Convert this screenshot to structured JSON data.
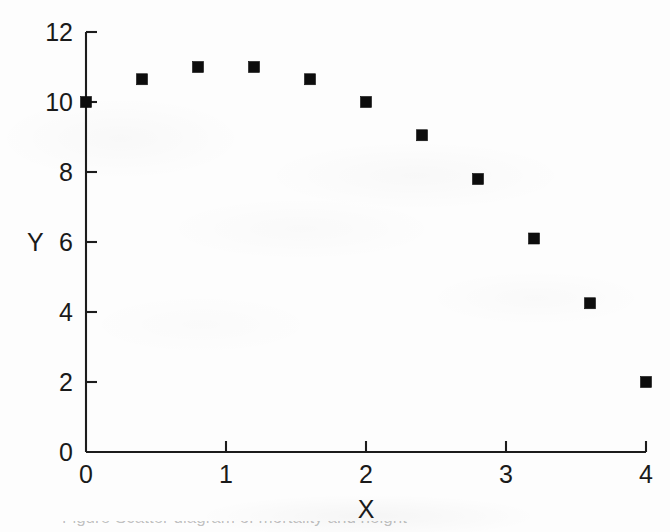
{
  "figure": {
    "background_color": "#fdfdfd",
    "ink_color": "#1a1a1a",
    "marker_color": "#0d0d0d",
    "x_axis_title": "X",
    "y_axis_title": "Y",
    "caption_fragment": "Figure    Scatter diagram of mortality and  height"
  },
  "chart_data": {
    "type": "scatter",
    "title": "",
    "xlabel": "X",
    "ylabel": "Y",
    "xlim": [
      0,
      4
    ],
    "ylim": [
      0,
      12
    ],
    "xticks": [
      0,
      1,
      2,
      3,
      4
    ],
    "yticks": [
      0,
      2,
      4,
      6,
      8,
      10,
      12
    ],
    "xtick_labels": [
      "0",
      "1",
      "2",
      "3",
      "4"
    ],
    "ytick_labels": [
      "0",
      "2",
      "4",
      "6",
      "8",
      "10",
      "12"
    ],
    "grid": false,
    "legend": false,
    "tick_direction": "in",
    "marker": "square",
    "marker_size": 11,
    "x": [
      0,
      0.4,
      0.8,
      1.2,
      1.6,
      2.0,
      2.4,
      2.8,
      3.2,
      3.6,
      4.0
    ],
    "y": [
      10.0,
      10.65,
      11.0,
      11.0,
      10.65,
      10.0,
      9.05,
      7.8,
      6.1,
      4.25,
      2.0
    ],
    "points": [
      {
        "x": 0,
        "y": 10.0
      },
      {
        "x": 0.4,
        "y": 10.65
      },
      {
        "x": 0.8,
        "y": 11.0
      },
      {
        "x": 1.2,
        "y": 11.0
      },
      {
        "x": 1.6,
        "y": 10.65
      },
      {
        "x": 2.0,
        "y": 10.0
      },
      {
        "x": 2.4,
        "y": 9.05
      },
      {
        "x": 2.8,
        "y": 7.8
      },
      {
        "x": 3.2,
        "y": 6.1
      },
      {
        "x": 3.6,
        "y": 4.25
      },
      {
        "x": 4.0,
        "y": 2.0
      }
    ]
  },
  "geometry": {
    "plot_left": 86,
    "plot_right": 646,
    "plot_top": 32,
    "plot_bottom": 452,
    "tick_len": 11
  }
}
